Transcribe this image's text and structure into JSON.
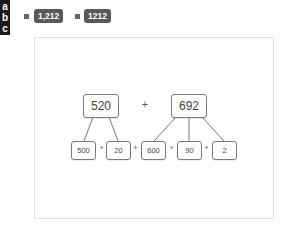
{
  "label_column": [
    "a",
    "b",
    "c"
  ],
  "header": {
    "badges": [
      {
        "text": "1,212"
      },
      {
        "text": "1212"
      }
    ]
  },
  "diagram": {
    "top": [
      {
        "value": "520"
      },
      {
        "operator": "+"
      },
      {
        "value": "692"
      }
    ],
    "bottom": [
      {
        "value": "500"
      },
      {
        "value": "20"
      },
      {
        "value": "600"
      },
      {
        "value": "90"
      },
      {
        "value": "2"
      }
    ],
    "operator": "+",
    "colors": {
      "border": "#7a7a7a",
      "badge": "#595959",
      "label_bg": "#1a1a1a"
    }
  }
}
